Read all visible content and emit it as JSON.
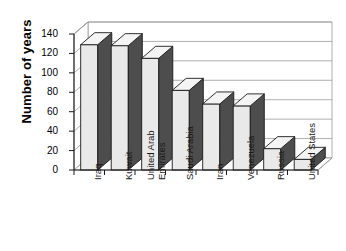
{
  "chart_data": {
    "type": "bar",
    "title": "",
    "subtitle": "",
    "xlabel": "",
    "ylabel": "Number of years",
    "categories": [
      "Iraq",
      "Kuwait",
      "United Arab Emirates",
      "Saudi Arabia",
      "Iran",
      "Venezuela",
      "Russia",
      "United States"
    ],
    "values": [
      129,
      128,
      115,
      82,
      68,
      66,
      22,
      11
    ],
    "ylim": [
      0,
      140
    ],
    "ytick_labels": [
      "0",
      "20",
      "40",
      "60",
      "80",
      "100",
      "120",
      "140"
    ],
    "ytick_values": [
      0,
      20,
      40,
      60,
      80,
      100,
      120,
      140
    ],
    "grid": true,
    "legend": false,
    "style": "3d-column",
    "colors": {
      "bar_face": "#e9e9e9",
      "bar_side": "#4d4d4d",
      "bar_top": "#f4f4f4",
      "bar_outline": "#1a1a1a",
      "gridline": "#9a9a9a",
      "axis": "#1a1a1a",
      "background": "#ffffff",
      "text": "#000000"
    }
  },
  "axis": {
    "y_title": "Number of years"
  },
  "category_labels": [
    {
      "line1": "Iraq",
      "line2": ""
    },
    {
      "line1": "Kuwait",
      "line2": ""
    },
    {
      "line1": "United Arab",
      "line2": "Emirates"
    },
    {
      "line1": "Saudi Arabia",
      "line2": ""
    },
    {
      "line1": "Iran",
      "line2": ""
    },
    {
      "line1": "Venezuela",
      "line2": ""
    },
    {
      "line1": "Russia",
      "line2": ""
    },
    {
      "line1": "United States",
      "line2": ""
    }
  ]
}
